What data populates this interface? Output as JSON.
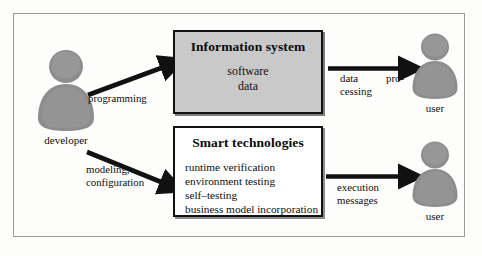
{
  "diagram": {
    "colors": {
      "frame_border": "#9a9a9a",
      "box_border": "#111111",
      "information_system_fill": "#c9c9c9",
      "smart_technologies_fill": "#ffffff",
      "person_fill": "#8d8d8d",
      "person_shade": "#7a7a7a",
      "arrow": "#111111",
      "background": "#fdfdfc"
    },
    "boxes": [
      {
        "id": "information-system",
        "title": "Information system",
        "lines": [
          "software",
          "data"
        ]
      },
      {
        "id": "smart-technologies",
        "title": "Smart technologies",
        "lines": [
          "runtime verification",
          "environment testing",
          "self–testing",
          "business model incorporation"
        ]
      }
    ],
    "actors": [
      {
        "id": "developer",
        "label": "developer"
      },
      {
        "id": "user-top",
        "label": "user"
      },
      {
        "id": "user-bottom",
        "label": "user"
      }
    ],
    "edges": [
      {
        "id": "programming",
        "from": "developer",
        "to": "information-system",
        "label_lines": [
          "programming"
        ]
      },
      {
        "id": "modeling-configuration",
        "from": "developer",
        "to": "smart-technologies",
        "label_lines": [
          "modeling,",
          "configuration"
        ]
      },
      {
        "id": "data-processing",
        "from": "information-system",
        "to": "user-top",
        "label_lines": [
          "data",
          "pro-",
          "cessing"
        ]
      },
      {
        "id": "execution-messages",
        "from": "smart-technologies",
        "to": "user-bottom",
        "label_lines": [
          "execution",
          "messages"
        ]
      }
    ]
  }
}
